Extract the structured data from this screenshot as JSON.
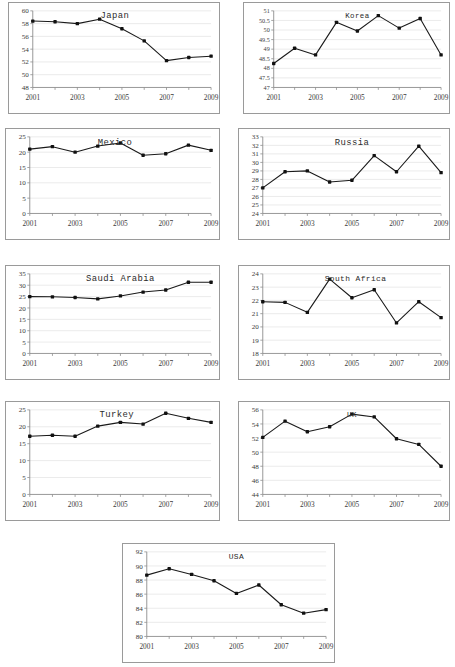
{
  "figure": {
    "panel_count": 9,
    "background_color": "#ffffff",
    "line_color": "#1a1a1a",
    "marker_color": "#111111",
    "gridline_color": "#e2e2e2",
    "axis_color": "#7d7d7d",
    "border_color": "#9a9a9a"
  },
  "chart_data": [
    {
      "type": "line",
      "title": "Japan",
      "xlabel": "",
      "ylabel": "",
      "x": [
        2001,
        2002,
        2003,
        2004,
        2005,
        2006,
        2007,
        2008,
        2009
      ],
      "values": [
        58.4,
        58.3,
        58.0,
        58.7,
        57.2,
        55.3,
        52.2,
        52.7,
        52.9
      ],
      "xlim": [
        2001,
        2009
      ],
      "ylim": [
        48,
        60
      ],
      "ytick_labels": [
        "48",
        "50",
        "52",
        "54",
        "56",
        "58",
        "60"
      ],
      "yticks": [
        48,
        50,
        52,
        54,
        56,
        58,
        60
      ],
      "xtick_labels": [
        "2001",
        "2003",
        "2005",
        "2007",
        "2009"
      ],
      "xticks": [
        2001,
        2003,
        2005,
        2007,
        2009
      ],
      "grid": true,
      "legend": "none"
    },
    {
      "type": "line",
      "title": "Korea",
      "xlabel": "",
      "ylabel": "",
      "x": [
        2001,
        2002,
        2003,
        2004,
        2005,
        2006,
        2007,
        2008,
        2009
      ],
      "values": [
        48.25,
        49.05,
        48.7,
        50.4,
        49.95,
        50.75,
        50.1,
        50.6,
        48.7
      ],
      "xlim": [
        2001,
        2009
      ],
      "ylim": [
        47,
        51
      ],
      "ytick_labels": [
        "47",
        "47.5",
        "48",
        "48.5",
        "49",
        "49.5",
        "50",
        "50.5",
        "51"
      ],
      "yticks": [
        47,
        47.5,
        48,
        48.5,
        49,
        49.5,
        50,
        50.5,
        51
      ],
      "xtick_labels": [
        "2001",
        "2003",
        "2005",
        "2007",
        "2009"
      ],
      "xticks": [
        2001,
        2003,
        2005,
        2007,
        2009
      ],
      "grid": true,
      "legend": "none"
    },
    {
      "type": "line",
      "title": "Mexico",
      "xlabel": "",
      "ylabel": "",
      "x": [
        2001,
        2002,
        2003,
        2004,
        2005,
        2006,
        2007,
        2008,
        2009
      ],
      "values": [
        21.0,
        21.8,
        20.0,
        22.0,
        23.0,
        19.0,
        19.5,
        22.3,
        20.6
      ],
      "xlim": [
        2001,
        2009
      ],
      "ylim": [
        0,
        25
      ],
      "ytick_labels": [
        "0",
        "5",
        "10",
        "15",
        "20",
        "25"
      ],
      "yticks": [
        0,
        5,
        10,
        15,
        20,
        25
      ],
      "xtick_labels": [
        "2001",
        "2003",
        "2005",
        "2007",
        "2009"
      ],
      "xticks": [
        2001,
        2003,
        2005,
        2007,
        2009
      ],
      "grid": true,
      "legend": "none"
    },
    {
      "type": "line",
      "title": "Russia",
      "xlabel": "",
      "ylabel": "",
      "x": [
        2001,
        2002,
        2003,
        2004,
        2005,
        2006,
        2007,
        2008,
        2009
      ],
      "values": [
        27.0,
        28.9,
        29.0,
        27.7,
        27.9,
        30.8,
        28.9,
        31.9,
        28.8
      ],
      "xlim": [
        2001,
        2009
      ],
      "ylim": [
        24,
        33
      ],
      "ytick_labels": [
        "24",
        "25",
        "26",
        "27",
        "28",
        "29",
        "30",
        "31",
        "32",
        "33"
      ],
      "yticks": [
        24,
        25,
        26,
        27,
        28,
        29,
        30,
        31,
        32,
        33
      ],
      "xtick_labels": [
        "2001",
        "2003",
        "2005",
        "2007",
        "2009"
      ],
      "xticks": [
        2001,
        2003,
        2005,
        2007,
        2009
      ],
      "grid": true,
      "legend": "none"
    },
    {
      "type": "line",
      "title": "Saudi Arabia",
      "xlabel": "",
      "ylabel": "",
      "x": [
        2001,
        2002,
        2003,
        2004,
        2005,
        2006,
        2007,
        2008,
        2009
      ],
      "values": [
        25.0,
        24.9,
        24.6,
        24.0,
        25.3,
        27.0,
        27.9,
        31.3,
        31.3
      ],
      "xlim": [
        2001,
        2009
      ],
      "ylim": [
        0,
        35
      ],
      "ytick_labels": [
        "0",
        "5",
        "10",
        "15",
        "20",
        "25",
        "30",
        "35"
      ],
      "yticks": [
        0,
        5,
        10,
        15,
        20,
        25,
        30,
        35
      ],
      "xtick_labels": [
        "2001",
        "2003",
        "2005",
        "2007",
        "2009"
      ],
      "xticks": [
        2001,
        2003,
        2005,
        2007,
        2009
      ],
      "grid": true,
      "legend": "none"
    },
    {
      "type": "line",
      "title": "South Africa",
      "xlabel": "",
      "ylabel": "",
      "x": [
        2001,
        2002,
        2003,
        2004,
        2005,
        2006,
        2007,
        2008,
        2009
      ],
      "values": [
        21.9,
        21.85,
        21.1,
        23.6,
        22.2,
        22.8,
        20.3,
        21.9,
        20.7
      ],
      "xlim": [
        2001,
        2009
      ],
      "ylim": [
        18,
        24
      ],
      "ytick_labels": [
        "18",
        "19",
        "20",
        "21",
        "22",
        "23",
        "24"
      ],
      "yticks": [
        18,
        19,
        20,
        21,
        22,
        23,
        24
      ],
      "xtick_labels": [
        "2001",
        "2003",
        "2005",
        "2007",
        "2009"
      ],
      "xticks": [
        2001,
        2003,
        2005,
        2007,
        2009
      ],
      "grid": true,
      "legend": "none"
    },
    {
      "type": "line",
      "title": "Turkey",
      "xlabel": "",
      "ylabel": "",
      "x": [
        2001,
        2002,
        2003,
        2004,
        2005,
        2006,
        2007,
        2008,
        2009
      ],
      "values": [
        17.2,
        17.5,
        17.2,
        20.2,
        21.3,
        20.8,
        24.0,
        22.5,
        21.3
      ],
      "xlim": [
        2001,
        2009
      ],
      "ylim": [
        0,
        25
      ],
      "ytick_labels": [
        "0",
        "5",
        "10",
        "15",
        "20",
        "25"
      ],
      "yticks": [
        0,
        5,
        10,
        15,
        20,
        25
      ],
      "xtick_labels": [
        "2001",
        "2003",
        "2005",
        "2007",
        "2009"
      ],
      "xticks": [
        2001,
        2003,
        2005,
        2007,
        2009
      ],
      "grid": true,
      "legend": "none"
    },
    {
      "type": "line",
      "title": "UK",
      "xlabel": "",
      "ylabel": "",
      "x": [
        2001,
        2002,
        2003,
        2004,
        2005,
        2006,
        2007,
        2008,
        2009
      ],
      "values": [
        52.1,
        54.4,
        52.9,
        53.6,
        55.4,
        55.0,
        51.9,
        51.1,
        48.0
      ],
      "xlim": [
        2001,
        2009
      ],
      "ylim": [
        44,
        56
      ],
      "ytick_labels": [
        "44",
        "46",
        "48",
        "50",
        "52",
        "54",
        "56"
      ],
      "yticks": [
        44,
        46,
        48,
        50,
        52,
        54,
        56
      ],
      "xtick_labels": [
        "2001",
        "2003",
        "2005",
        "2007",
        "2009"
      ],
      "xticks": [
        2001,
        2003,
        2005,
        2007,
        2009
      ],
      "grid": true,
      "legend": "none"
    },
    {
      "type": "line",
      "title": "USA",
      "xlabel": "",
      "ylabel": "",
      "x": [
        2001,
        2002,
        2003,
        2004,
        2005,
        2006,
        2007,
        2008,
        2009
      ],
      "values": [
        88.7,
        89.6,
        88.8,
        87.9,
        86.1,
        87.3,
        84.5,
        83.3,
        83.8
      ],
      "xlim": [
        2001,
        2009
      ],
      "ylim": [
        80,
        92
      ],
      "ytick_labels": [
        "80",
        "82",
        "84",
        "86",
        "88",
        "90",
        "92"
      ],
      "yticks": [
        80,
        82,
        84,
        86,
        88,
        90,
        92
      ],
      "xtick_labels": [
        "2001",
        "2003",
        "2005",
        "2007",
        "2009"
      ],
      "xticks": [
        2001,
        2003,
        2005,
        2007,
        2009
      ],
      "grid": true,
      "legend": "none"
    }
  ],
  "layout": {
    "panels": [
      {
        "name": "panel-japan",
        "left": 8,
        "top": 2,
        "width": 212,
        "height": 112,
        "title_dx": 0.46,
        "title_dy": 0.09,
        "title_size": 9
      },
      {
        "name": "panel-korea",
        "left": 243,
        "top": 2,
        "width": 207,
        "height": 112,
        "title_dx": 0.5,
        "title_dy": 0.09,
        "title_size": 7.5
      },
      {
        "name": "panel-mexico",
        "left": 5,
        "top": 128,
        "width": 215,
        "height": 112,
        "title_dx": 0.47,
        "title_dy": 0.1,
        "title_size": 9
      },
      {
        "name": "panel-russia",
        "left": 238,
        "top": 128,
        "width": 212,
        "height": 112,
        "title_dx": 0.5,
        "title_dy": 0.1,
        "title_size": 9
      },
      {
        "name": "panel-saudi-arabia",
        "left": 5,
        "top": 265,
        "width": 215,
        "height": 115,
        "title_dx": 0.5,
        "title_dy": 0.09,
        "title_size": 9
      },
      {
        "name": "panel-south-africa",
        "left": 238,
        "top": 265,
        "width": 212,
        "height": 115,
        "title_dx": 0.52,
        "title_dy": 0.09,
        "title_size": 8
      },
      {
        "name": "panel-turkey",
        "left": 5,
        "top": 401,
        "width": 215,
        "height": 120,
        "title_dx": 0.48,
        "title_dy": 0.09,
        "title_size": 9
      },
      {
        "name": "panel-uk",
        "left": 238,
        "top": 401,
        "width": 212,
        "height": 120,
        "title_dx": 0.5,
        "title_dy": 0.09,
        "title_size": 7.5
      },
      {
        "name": "panel-usa",
        "left": 122,
        "top": 543,
        "width": 213,
        "height": 120,
        "title_dx": 0.5,
        "title_dy": 0.09,
        "title_size": 8
      }
    ]
  }
}
